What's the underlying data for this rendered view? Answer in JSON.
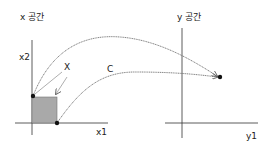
{
  "x_space": {
    "title": "x 공간",
    "axis_vertical_label": "x2",
    "axis_horizontal_label": "x1",
    "region_label": "X"
  },
  "y_space": {
    "title": "y 공간",
    "axis_horizontal_label": "y1"
  },
  "mapping_label": "C",
  "colors": {
    "axis": "#333333",
    "region_fill": "#a9a9a9",
    "curve": "#666666",
    "point": "#111111"
  }
}
